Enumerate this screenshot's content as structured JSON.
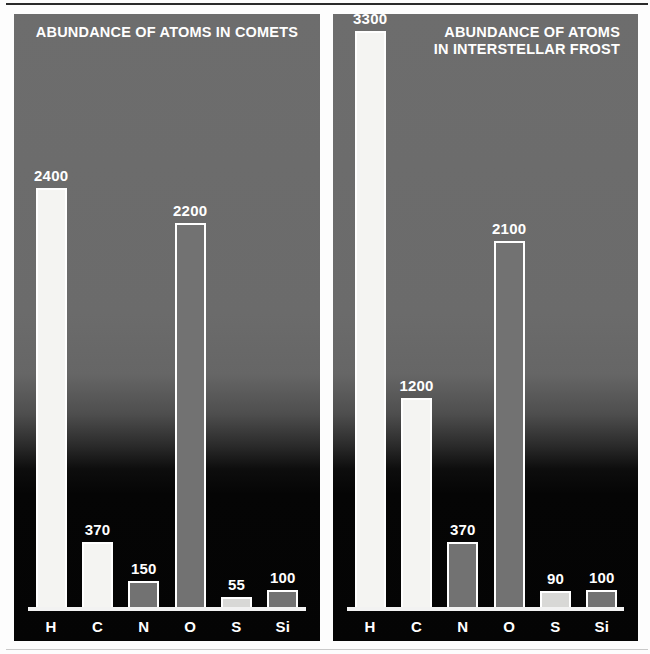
{
  "chart_data": [
    {
      "type": "bar",
      "title": "ABUNDANCE OF ATOMS IN COMETS",
      "title_lines": [
        "ABUNDANCE OF ATOMS IN COMETS"
      ],
      "title_align": "center",
      "panel": "left",
      "xlabel": "",
      "ylabel": "",
      "grid": false,
      "legend": "none",
      "ylim": [
        0,
        3400
      ],
      "categories": [
        "H",
        "C",
        "N",
        "O",
        "S",
        "Si"
      ],
      "values": [
        2400,
        370,
        150,
        2200,
        55,
        100
      ],
      "value_labels": [
        "2400",
        "370",
        "150",
        "2200",
        "55",
        "100"
      ],
      "bar_fills": [
        "light",
        "light",
        "gray",
        "gray",
        "mid",
        "gray"
      ]
    },
    {
      "type": "bar",
      "title": "ABUNDANCE OF ATOMS IN INTERSTELLAR FROST",
      "title_lines": [
        "ABUNDANCE OF ATOMS",
        "IN INTERSTELLAR FROST"
      ],
      "title_align": "right",
      "panel": "right",
      "xlabel": "",
      "ylabel": "",
      "grid": false,
      "legend": "none",
      "ylim": [
        0,
        3400
      ],
      "categories": [
        "H",
        "C",
        "N",
        "O",
        "S",
        "Si"
      ],
      "values": [
        3300,
        1200,
        370,
        2100,
        90,
        100
      ],
      "value_labels": [
        "3300",
        "1200",
        "370",
        "2100",
        "90",
        "100"
      ],
      "bar_fills": [
        "light",
        "light",
        "gray",
        "gray",
        "mid",
        "gray"
      ]
    }
  ],
  "colors": {
    "panel_top": "#6d6d6d",
    "panel_bottom": "#040404",
    "bar_light": "#f4f4f2",
    "bar_mid": "#d8d8d6",
    "bar_gray": "#727272",
    "bar_outline": "#ffffff",
    "text": "#ffffff",
    "page_background": "#fdfdfd"
  }
}
